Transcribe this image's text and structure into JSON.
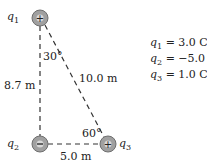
{
  "charges": [
    {
      "id": "q1",
      "label": "q",
      "sub": "1",
      "sign": "+",
      "value_text": "= 3.0 C"
    },
    {
      "id": "q2",
      "label": "q",
      "sub": "2",
      "sign": "−",
      "value_text": "= −5.0 C"
    },
    {
      "id": "q3",
      "label": "q",
      "sub": "3",
      "sign": "+",
      "value_text": "= 1.0 C"
    }
  ],
  "distances": {
    "q1_q2": "8.7 m",
    "q1_q3": "10.0 m",
    "q2_q3": "5.0 m"
  },
  "angles": {
    "at_q1": "30°",
    "at_q3": "60°"
  },
  "colors": {
    "charge_fill": "#a0a0a0",
    "charge_stroke": "#6e6e6e",
    "line": "#333333"
  }
}
